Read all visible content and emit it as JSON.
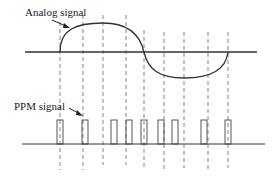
{
  "diagram": {
    "labels": {
      "analog": "Analog signal",
      "ppm": "PPM signal"
    },
    "sample_count": 9,
    "colors": {
      "line": "#333333",
      "dashed": "#666666",
      "pulse": "#444444"
    }
  }
}
